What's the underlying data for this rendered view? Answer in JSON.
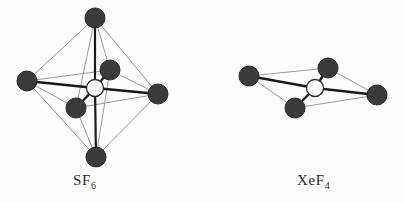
{
  "figure": {
    "background_color": "#fefefe",
    "atom_fill_color": "#3a3a3a",
    "atom_stroke_color": "#2b2b2b",
    "center_atom_fill_color": "#ffffff",
    "bond_color": "#1a1a1a",
    "edge_color": "#9a9a9a",
    "label_color": "#2b2b2b"
  },
  "molecules": [
    {
      "id": "sf6",
      "name": "sulfur-hexafluoride",
      "label_main": "SF",
      "label_sub": "6",
      "geometry": "octahedral",
      "center": {
        "cx": 95,
        "cy": 88,
        "r": 8.5
      },
      "atoms": [
        {
          "name": "apex-top",
          "cx": 95,
          "cy": 18,
          "r": 10
        },
        {
          "name": "equatorial-left",
          "cx": 27,
          "cy": 81,
          "r": 10
        },
        {
          "name": "equatorial-right",
          "cx": 158,
          "cy": 94,
          "r": 10
        },
        {
          "name": "apex-bottom",
          "cx": 96,
          "cy": 157,
          "r": 10
        },
        {
          "name": "equatorial-front-up",
          "cx": 110,
          "cy": 70,
          "r": 10
        },
        {
          "name": "equatorial-front-dn",
          "cx": 76,
          "cy": 108,
          "r": 10
        }
      ],
      "bonds": [
        {
          "name": "bond-center-top",
          "x1": 95,
          "y1": 88,
          "x2": 95,
          "y2": 18
        },
        {
          "name": "bond-center-bottom",
          "x1": 95,
          "y1": 88,
          "x2": 96,
          "y2": 157
        },
        {
          "name": "bond-center-left",
          "x1": 95,
          "y1": 88,
          "x2": 27,
          "y2": 81
        },
        {
          "name": "bond-center-right",
          "x1": 95,
          "y1": 88,
          "x2": 158,
          "y2": 94
        },
        {
          "name": "bond-center-frontup",
          "x1": 95,
          "y1": 88,
          "x2": 110,
          "y2": 70
        },
        {
          "name": "bond-center-frontdn",
          "x1": 95,
          "y1": 88,
          "x2": 76,
          "y2": 108
        }
      ],
      "edges": [
        {
          "name": "edge-top-left",
          "x1": 95,
          "y1": 18,
          "x2": 27,
          "y2": 81
        },
        {
          "name": "edge-top-right",
          "x1": 95,
          "y1": 18,
          "x2": 158,
          "y2": 94
        },
        {
          "name": "edge-top-frontup",
          "x1": 95,
          "y1": 18,
          "x2": 110,
          "y2": 70
        },
        {
          "name": "edge-top-frontdn",
          "x1": 95,
          "y1": 18,
          "x2": 76,
          "y2": 108
        },
        {
          "name": "edge-bottom-left",
          "x1": 96,
          "y1": 157,
          "x2": 27,
          "y2": 81
        },
        {
          "name": "edge-bottom-right",
          "x1": 96,
          "y1": 157,
          "x2": 158,
          "y2": 94
        },
        {
          "name": "edge-bottom-frontup",
          "x1": 96,
          "y1": 157,
          "x2": 110,
          "y2": 70
        },
        {
          "name": "edge-bottom-frontdn",
          "x1": 96,
          "y1": 157,
          "x2": 76,
          "y2": 108
        },
        {
          "name": "edge-left-frontup",
          "x1": 27,
          "y1": 81,
          "x2": 110,
          "y2": 70
        },
        {
          "name": "edge-left-frontdn",
          "x1": 27,
          "y1": 81,
          "x2": 76,
          "y2": 108
        },
        {
          "name": "edge-right-frontup",
          "x1": 158,
          "y1": 94,
          "x2": 110,
          "y2": 70
        },
        {
          "name": "edge-right-frontdn",
          "x1": 158,
          "y1": 94,
          "x2": 76,
          "y2": 108
        }
      ]
    },
    {
      "id": "xef4",
      "name": "xenon-tetrafluoride",
      "label_main": "XeF",
      "label_sub": "4",
      "geometry": "square-planar",
      "center": {
        "cx": 315,
        "cy": 88,
        "r": 8.5
      },
      "atoms": [
        {
          "name": "corner-left",
          "cx": 249,
          "cy": 76,
          "r": 10
        },
        {
          "name": "corner-top-right",
          "cx": 328,
          "cy": 68,
          "r": 10
        },
        {
          "name": "corner-right",
          "cx": 377,
          "cy": 95,
          "r": 10
        },
        {
          "name": "corner-bottom-left",
          "cx": 295,
          "cy": 108,
          "r": 10
        }
      ],
      "bonds": [
        {
          "name": "bond-center-left",
          "x1": 315,
          "y1": 88,
          "x2": 249,
          "y2": 76
        },
        {
          "name": "bond-center-topright",
          "x1": 315,
          "y1": 88,
          "x2": 328,
          "y2": 68
        },
        {
          "name": "bond-center-right",
          "x1": 315,
          "y1": 88,
          "x2": 377,
          "y2": 95
        },
        {
          "name": "bond-center-bottomleft",
          "x1": 315,
          "y1": 88,
          "x2": 295,
          "y2": 108
        }
      ],
      "edges": [
        {
          "name": "edge-left-topright",
          "x1": 249,
          "y1": 76,
          "x2": 328,
          "y2": 68
        },
        {
          "name": "edge-topright-right",
          "x1": 328,
          "y1": 68,
          "x2": 377,
          "y2": 95
        },
        {
          "name": "edge-right-bottomleft",
          "x1": 377,
          "y1": 95,
          "x2": 295,
          "y2": 108
        },
        {
          "name": "edge-bottomleft-left",
          "x1": 295,
          "y1": 108,
          "x2": 249,
          "y2": 76
        }
      ]
    }
  ]
}
